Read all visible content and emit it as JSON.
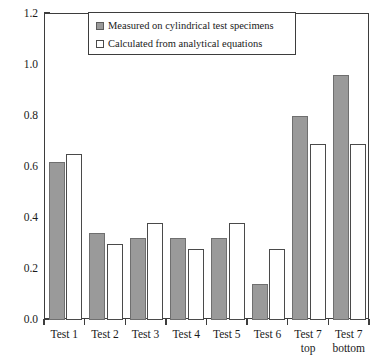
{
  "chart_data": {
    "type": "bar",
    "title": "",
    "xlabel": "",
    "ylabel": "Relative sliding in axial direction (mm)",
    "ylim": [
      0.0,
      1.2
    ],
    "ytick_labels": [
      "0.0",
      "0.2",
      "0.4",
      "0.6",
      "0.8",
      "1.0",
      "1.2"
    ],
    "ytick_values": [
      0.0,
      0.2,
      0.4,
      0.6,
      0.8,
      1.0,
      1.2
    ],
    "grid": false,
    "legend_position": "top-center",
    "categories": [
      "Test 1",
      "Test 2",
      "Test 3",
      "Test 4",
      "Test 5",
      "Test 6",
      "Test 7 top",
      "Test 7 bottom"
    ],
    "category_lines": [
      [
        "Test 1"
      ],
      [
        "Test 2"
      ],
      [
        "Test 3"
      ],
      [
        "Test 4"
      ],
      [
        "Test 5"
      ],
      [
        "Test 6"
      ],
      [
        "Test 7",
        "top"
      ],
      [
        "Test 7",
        "bottom"
      ]
    ],
    "series": [
      {
        "name": "Measured on cylindrical test specimens",
        "color": "#9a9a9a",
        "values": [
          0.62,
          0.34,
          0.32,
          0.32,
          0.32,
          0.14,
          0.8,
          0.96
        ]
      },
      {
        "name": "Calculated from analytical equations",
        "color": "#ffffff",
        "values": [
          0.65,
          0.3,
          0.38,
          0.28,
          0.38,
          0.28,
          0.69,
          0.69
        ]
      }
    ]
  },
  "legend": {
    "items": [
      {
        "label": "Measured on cylindrical test specimens",
        "style": "measured"
      },
      {
        "label": "Calculated from analytical equations",
        "style": "calculated"
      }
    ]
  }
}
